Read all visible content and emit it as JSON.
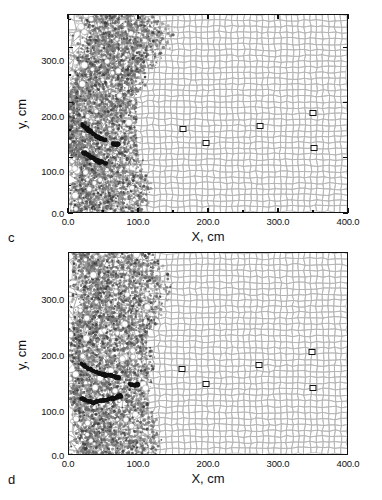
{
  "figure": {
    "type": "scientific-figure",
    "panels": [
      "c",
      "d"
    ],
    "background_color": "#ffffff",
    "ink_color": "#111111",
    "mesh_color": "#b4b4b4",
    "damage_color": "#6e6e6e",
    "crack_color": "#101010"
  },
  "panel_c": {
    "label": "c",
    "x_axis": {
      "title": "X, cm",
      "ticks": [
        "0.0",
        "100.0",
        "200.0",
        "300.0",
        "400.0"
      ],
      "tick_values": [
        0,
        100,
        200,
        300,
        400
      ],
      "min": 0,
      "max": 400
    },
    "y_axis": {
      "title": "y, cm",
      "ticks": [
        "0.0",
        "100.0",
        "200.0",
        "300.0"
      ],
      "tick_values": [
        0,
        100,
        200,
        300
      ],
      "min": 0,
      "max": 360
    },
    "markers": [
      {
        "x": 163,
        "y": 154
      },
      {
        "x": 196,
        "y": 128
      },
      {
        "x": 273,
        "y": 160
      },
      {
        "x": 348,
        "y": 183
      },
      {
        "x": 350,
        "y": 119
      }
    ]
  },
  "panel_d": {
    "label": "d",
    "x_axis": {
      "title": "X, cm",
      "ticks": [
        "0.0",
        "100.0",
        "200.0",
        "300.0",
        "400.0"
      ],
      "tick_values": [
        0,
        100,
        200,
        300,
        400
      ],
      "min": 0,
      "max": 400
    },
    "y_axis": {
      "title": "y, cm",
      "ticks": [
        "0.0",
        "100.0",
        "200.0",
        "300.0"
      ],
      "tick_values": [
        0,
        100,
        200,
        300
      ],
      "min": 0,
      "max": 360
    },
    "markers": [
      {
        "x": 161,
        "y": 155
      },
      {
        "x": 196,
        "y": 127
      },
      {
        "x": 272,
        "y": 161
      },
      {
        "x": 347,
        "y": 185
      },
      {
        "x": 349,
        "y": 120
      }
    ]
  },
  "chart_data": {
    "type": "scatter",
    "title": "",
    "xlabel": "X, cm",
    "ylabel": "y, cm",
    "xlim": [
      0,
      400
    ],
    "ylim": [
      0,
      360
    ],
    "grid": false,
    "legend": "none",
    "panels": [
      {
        "name": "c",
        "description": "Lagrangian mesh of deformed cells filling the domain; a dense dark damaged/fragmented zone hugs the left boundary (x < ~70 cm) with a lobe bulging to x ~ 90 cm near y ~ 230-300 cm and near y ~ 0-60 cm; black crack segments near x 15-60 cm at y ~ 85-160 cm; five open square tracer markers in the intact mesh.",
        "series": [
          {
            "name": "tracer markers",
            "marker": "open-square",
            "x": [
              163,
              196,
              273,
              348,
              350
            ],
            "y": [
              154,
              128,
              160,
              183,
              119
            ]
          }
        ],
        "damage_zone": {
          "x_extent": [
            0,
            95
          ],
          "y_extent": [
            0,
            360
          ],
          "shade": "#6e6e6e"
        },
        "cracks": [
          {
            "x": [
              18,
              30,
              42,
              52
            ],
            "y": [
              160,
              148,
              136,
              130
            ]
          },
          {
            "x": [
              20,
              32,
              44,
              54
            ],
            "y": [
              110,
              100,
              92,
              88
            ]
          },
          {
            "x": [
              62,
              70
            ],
            "y": [
              124,
              124
            ]
          }
        ]
      },
      {
        "name": "d",
        "description": "Same Lagrangian mesh at a later time; the damaged zone along the left boundary is wider and more diffuse (x < ~80 cm) with voids opening; black crack segments extend farther to the right, reaching x ~ 95 cm at y ~ 124 cm; the same five open square tracer markers remain in the intact mesh.",
        "series": [
          {
            "name": "tracer markers",
            "marker": "open-square",
            "x": [
              161,
              196,
              272,
              347,
              349
            ],
            "y": [
              155,
              127,
              161,
              185,
              120
            ]
          }
        ],
        "damage_zone": {
          "x_extent": [
            0,
            105
          ],
          "y_extent": [
            0,
            360
          ],
          "shade": "#6e6e6e"
        },
        "cracks": [
          {
            "x": [
              18,
              32,
              48,
              62,
              72
            ],
            "y": [
              162,
              150,
              142,
              140,
              136
            ]
          },
          {
            "x": [
              18,
              34,
              50,
              64,
              74
            ],
            "y": [
              100,
              92,
              96,
              100,
              104
            ]
          },
          {
            "x": [
              88,
              100
            ],
            "y": [
              124,
              124
            ]
          }
        ]
      }
    ]
  }
}
